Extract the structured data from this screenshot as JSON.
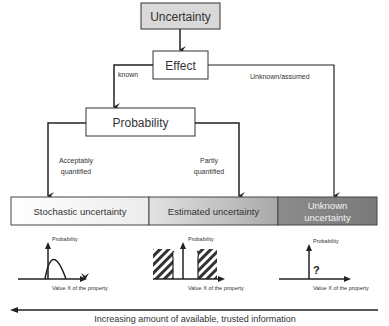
{
  "nodes": {
    "uncertainty": "Uncertainty",
    "effect": "Effect",
    "probability": "Probability"
  },
  "edges": {
    "known": "known",
    "unknown_assumed": "Unknown/assumed",
    "acceptably_line1": "Acceptably",
    "acceptably_line2": "quantified",
    "partly_line1": "Partly",
    "partly_line2": "quantified"
  },
  "categories": [
    {
      "label_line1": "Stochastic uncertainty",
      "label_line2": ""
    },
    {
      "label_line1": "Estimated uncertainty",
      "label_line2": ""
    },
    {
      "label_line1": "Unknown",
      "label_line2": "uncertainty"
    }
  ],
  "plots": [
    {
      "y_label": "Probability",
      "x_label": "Value X of the property",
      "marker": ""
    },
    {
      "y_label": "Probability",
      "x_label": "Value X of the property",
      "marker": ""
    },
    {
      "y_label": "Probability",
      "x_label": "Value X of the property",
      "marker": "?"
    }
  ],
  "footer": {
    "arrow_caption": "Increasing amount of available, trusted information"
  },
  "colors": {
    "top_box_fill": "#d9d9d9",
    "stochastic_fill": "#ffffff",
    "estimated_fill_start": "#e4e4e4",
    "estimated_fill_end": "#a8a8a8",
    "unknown_fill": "#858585",
    "line": "#222222"
  }
}
